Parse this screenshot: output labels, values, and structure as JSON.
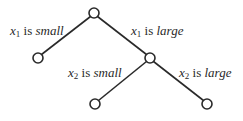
{
  "diagram": {
    "type": "decision-tree",
    "nodes": [
      {
        "id": "root",
        "x": 94,
        "y": 13
      },
      {
        "id": "left-leaf",
        "x": 38,
        "y": 58
      },
      {
        "id": "mid",
        "x": 150,
        "y": 58
      },
      {
        "id": "bottom-left-leaf",
        "x": 95,
        "y": 104
      },
      {
        "id": "bottom-right-leaf",
        "x": 207,
        "y": 104
      }
    ],
    "edges": [
      {
        "from": "root",
        "to": "left-leaf",
        "label": {
          "var": "x",
          "sub": "1",
          "is": "is",
          "value": "small"
        }
      },
      {
        "from": "root",
        "to": "mid",
        "label": {
          "var": "x",
          "sub": "1",
          "is": "is",
          "value": "large"
        }
      },
      {
        "from": "mid",
        "to": "bottom-left-leaf",
        "label": {
          "var": "x",
          "sub": "2",
          "is": "is",
          "value": "small"
        }
      },
      {
        "from": "mid",
        "to": "bottom-right-leaf",
        "label": {
          "var": "x",
          "sub": "2",
          "is": "is",
          "value": "large"
        }
      }
    ],
    "colors": {
      "stroke": "#2a2a2a",
      "background": "#ffffff"
    }
  }
}
